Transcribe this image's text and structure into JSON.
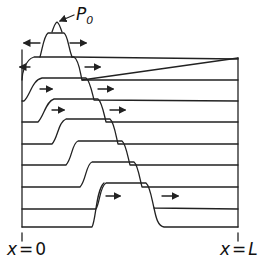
{
  "figure": {
    "peak_label": {
      "symbol": "P",
      "subscript": "0"
    },
    "left_boundary_label": {
      "var": "x",
      "eq": "=",
      "value": "0"
    },
    "right_boundary_label": {
      "var": "x",
      "eq": "=",
      "value": "L"
    },
    "colors": {
      "line": "#222222",
      "background": "#ffffff"
    },
    "arrow_directions": [
      "left",
      "right"
    ],
    "profile_count": 9
  }
}
